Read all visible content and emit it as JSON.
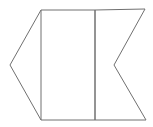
{
  "diagram": {
    "stroke_color": "#707070",
    "background_color": "#ffffff",
    "shapes": {
      "left_triangle": [
        [
          41,
          10
        ],
        [
          10,
          65
        ],
        [
          41,
          120
        ]
      ],
      "left_panel": [
        [
          41,
          10
        ],
        [
          95,
          10
        ],
        [
          95,
          120
        ],
        [
          41,
          120
        ]
      ],
      "right_notched_panel": [
        [
          95,
          10
        ],
        [
          145,
          9
        ],
        [
          114,
          65
        ],
        [
          146,
          120
        ],
        [
          95,
          120
        ]
      ],
      "divider_line": [
        [
          95,
          10
        ],
        [
          95,
          120
        ]
      ]
    }
  }
}
